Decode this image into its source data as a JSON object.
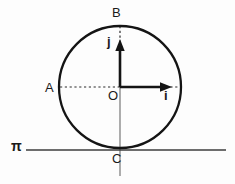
{
  "figure": {
    "background_color": "#fdfdfd",
    "stroke_color": "#1a1a1a",
    "thin_stroke_color": "#555555",
    "labels": {
      "point_top": "B",
      "point_left": "A",
      "origin": "O",
      "point_bottom": "C",
      "vector_x": "i",
      "vector_y": "j",
      "plane": "π"
    },
    "circle": {
      "center_x": 120,
      "center_y": 87,
      "radius": 61
    },
    "plane_line": {
      "y": 150,
      "x_start": 26,
      "x_end": 226
    },
    "vector_i": {
      "from_x": 120,
      "from_y": 87,
      "to_x": 171,
      "to_y": 87
    },
    "vector_j": {
      "from_x": 120,
      "from_y": 87,
      "to_x": 120,
      "to_y": 40
    },
    "dotted_horizontal": {
      "y": 87,
      "x_start": 60,
      "x_end": 181
    },
    "dotted_vertical": {
      "x": 120,
      "y_start": 26,
      "y_end": 87
    },
    "axis_extension": {
      "x": 120,
      "y_start": 87,
      "y_end": 176
    }
  }
}
